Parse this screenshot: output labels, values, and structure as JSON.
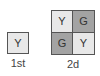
{
  "figures": [
    {
      "label": "1st",
      "cells": [
        {
          "text": "Y",
          "shade": "light"
        }
      ]
    },
    {
      "label": "2d",
      "cells": [
        {
          "text": "Y",
          "shade": "light"
        },
        {
          "text": "G",
          "shade": "dark"
        },
        {
          "text": "G",
          "shade": "dark"
        },
        {
          "text": "Y",
          "shade": "light"
        }
      ]
    }
  ],
  "colors": {
    "light": "#e8e8e8",
    "dark": "#a3a3a3",
    "border": "#555555"
  }
}
